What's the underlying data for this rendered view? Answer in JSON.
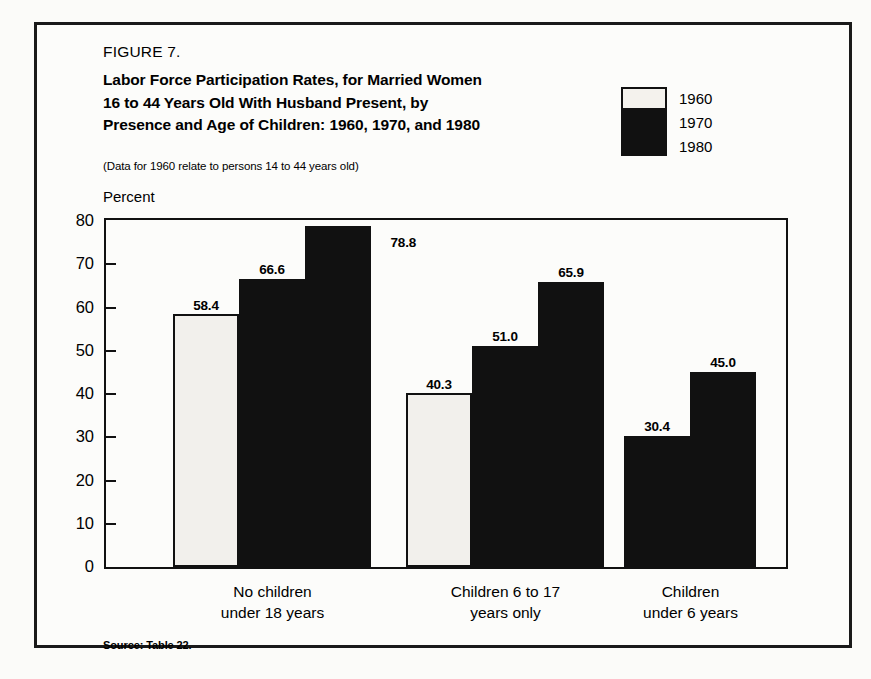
{
  "figure": {
    "number": "FIGURE 7.",
    "title_lines": [
      "Labor Force Participation Rates, for Married Women",
      "16 to 44 Years Old  With Husband Present, by",
      "Presence and Age of Children: 1960, 1970, and 1980"
    ],
    "note": "(Data for 1960 relate to persons 14 to 44 years old)",
    "source": "Source: Table 22."
  },
  "legend": {
    "entries": [
      {
        "label": "1960",
        "color": "#f4f2ed"
      },
      {
        "label": "1970",
        "color": "#111111"
      },
      {
        "label": "1980",
        "color": "#111111"
      }
    ]
  },
  "chart_data": {
    "type": "bar",
    "title": "Labor Force Participation Rates, for Married Women 16 to 44 Years Old With Husband Present, by Presence and Age of Children: 1960, 1970, and 1980",
    "subtitle": "(Data for 1960 relate to persons 14 to 44 years old)",
    "xlabel": "",
    "ylabel": "Percent",
    "ylim": [
      0,
      80
    ],
    "yticks": [
      "0",
      "10",
      "20",
      "30",
      "40",
      "50",
      "60",
      "70",
      "80"
    ],
    "grid": false,
    "legend_position": "top-right",
    "categories": [
      "No children\nunder 18 years",
      "Children  6 to 17\nyears only",
      "Children\nunder 6 years"
    ],
    "category_lines": [
      [
        "No children",
        "under 18 years"
      ],
      [
        "Children  6 to 17",
        "years only"
      ],
      [
        "Children",
        "under 6 years"
      ]
    ],
    "series": [
      {
        "name": "1960",
        "values": [
          58.4,
          40.3,
          null
        ],
        "color": "#f4f2ed"
      },
      {
        "name": "1970",
        "values": [
          66.6,
          51.0,
          30.4
        ],
        "color": "#111111"
      },
      {
        "name": "1980",
        "values": [
          78.8,
          65.9,
          45.0
        ],
        "color": "#111111"
      }
    ],
    "data_labels": {
      "group1": [
        "58.4",
        "66.6",
        "78.8"
      ],
      "group2": [
        "40.3",
        "51.0",
        "65.9"
      ],
      "group3": [
        "30.4",
        "45.0"
      ]
    }
  }
}
